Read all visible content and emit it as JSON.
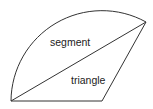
{
  "diagram": {
    "labels": {
      "segment": "segment",
      "triangle": "triangle"
    },
    "stroke_color": "#333333",
    "background": "#ffffff"
  }
}
